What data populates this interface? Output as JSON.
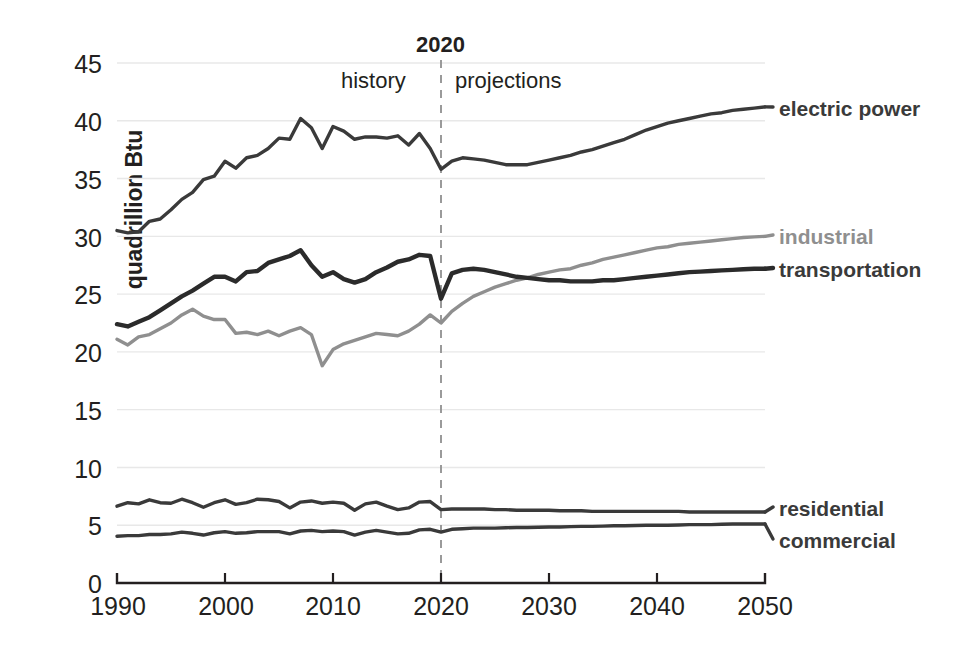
{
  "chart_data": {
    "type": "line",
    "title": "",
    "xlabel": "",
    "ylabel": "quadrillion Btu",
    "xlim": [
      1990,
      2050
    ],
    "ylim": [
      0,
      45
    ],
    "grid": true,
    "legend_position": "right-inline",
    "xticks": [
      1990,
      2000,
      2010,
      2020,
      2030,
      2040,
      2050
    ],
    "yticks": [
      0,
      5,
      10,
      15,
      20,
      25,
      30,
      35,
      40,
      45
    ],
    "annotations": {
      "divider_year": "2020",
      "left_region": "history",
      "right_region": "projections"
    },
    "colors": {
      "electric_power": "#3a3a3a",
      "industrial": "#8f8f8f",
      "transportation": "#2b2b2b",
      "residential": "#3a3a3a",
      "commercial": "#3a3a3a",
      "grid": "#e8e8e8",
      "axis": "#231f20",
      "divider": "#9a9a9a"
    },
    "x": [
      1990,
      1991,
      1992,
      1993,
      1994,
      1995,
      1996,
      1997,
      1998,
      1999,
      2000,
      2001,
      2002,
      2003,
      2004,
      2005,
      2006,
      2007,
      2008,
      2009,
      2010,
      2011,
      2012,
      2013,
      2014,
      2015,
      2016,
      2017,
      2018,
      2019,
      2020,
      2021,
      2022,
      2023,
      2024,
      2025,
      2026,
      2027,
      2028,
      2029,
      2030,
      2031,
      2032,
      2033,
      2034,
      2035,
      2036,
      2037,
      2038,
      2039,
      2040,
      2041,
      2042,
      2043,
      2044,
      2045,
      2046,
      2047,
      2048,
      2049,
      2050
    ],
    "series": [
      {
        "name": "electric power",
        "color": "#3a3a3a",
        "label_x": 779,
        "label_y": 98,
        "values": [
          30.5,
          30.3,
          30.4,
          31.3,
          31.5,
          32.3,
          33.2,
          33.8,
          34.9,
          35.2,
          36.5,
          35.9,
          36.8,
          37.0,
          37.6,
          38.5,
          38.4,
          40.2,
          39.4,
          37.6,
          39.5,
          39.1,
          38.4,
          38.6,
          38.6,
          38.5,
          38.7,
          37.9,
          38.9,
          37.6,
          35.8,
          36.5,
          36.8,
          36.7,
          36.6,
          36.4,
          36.2,
          36.2,
          36.2,
          36.4,
          36.6,
          36.8,
          37.0,
          37.3,
          37.5,
          37.8,
          38.1,
          38.4,
          38.8,
          39.2,
          39.5,
          39.8,
          40.0,
          40.2,
          40.4,
          40.6,
          40.7,
          40.9,
          41.0,
          41.1,
          41.2
        ]
      },
      {
        "name": "industrial",
        "color": "#8f8f8f",
        "label_x": 779,
        "label_y": 226,
        "values": [
          21.1,
          20.6,
          21.3,
          21.5,
          22.0,
          22.5,
          23.2,
          23.7,
          23.1,
          22.8,
          22.8,
          21.6,
          21.7,
          21.5,
          21.8,
          21.4,
          21.8,
          22.1,
          21.5,
          18.8,
          20.2,
          20.7,
          21.0,
          21.3,
          21.6,
          21.5,
          21.4,
          21.8,
          22.4,
          23.2,
          22.5,
          23.5,
          24.2,
          24.8,
          25.2,
          25.6,
          25.9,
          26.2,
          26.4,
          26.7,
          26.9,
          27.1,
          27.2,
          27.5,
          27.7,
          28.0,
          28.2,
          28.4,
          28.6,
          28.8,
          29.0,
          29.1,
          29.3,
          29.4,
          29.5,
          29.6,
          29.7,
          29.8,
          29.9,
          29.95,
          30.0
        ]
      },
      {
        "name": "transportation",
        "color": "#2b2b2b",
        "label_x": 779,
        "label_y": 259,
        "values": [
          22.4,
          22.2,
          22.6,
          23.0,
          23.6,
          24.2,
          24.8,
          25.3,
          25.9,
          26.5,
          26.5,
          26.1,
          26.9,
          27.0,
          27.7,
          28.0,
          28.3,
          28.8,
          27.5,
          26.5,
          26.9,
          26.3,
          26.0,
          26.3,
          26.9,
          27.3,
          27.8,
          28.0,
          28.4,
          28.3,
          24.6,
          26.8,
          27.1,
          27.2,
          27.1,
          26.9,
          26.7,
          26.5,
          26.4,
          26.3,
          26.2,
          26.2,
          26.1,
          26.1,
          26.1,
          26.2,
          26.2,
          26.3,
          26.4,
          26.5,
          26.6,
          26.7,
          26.8,
          26.9,
          26.95,
          27.0,
          27.05,
          27.1,
          27.15,
          27.2,
          27.2
        ]
      },
      {
        "name": "residential",
        "color": "#3a3a3a",
        "label_x": 779,
        "label_y": 498,
        "values": [
          6.65,
          6.95,
          6.85,
          7.2,
          6.95,
          6.9,
          7.25,
          6.95,
          6.55,
          6.95,
          7.2,
          6.8,
          6.95,
          7.25,
          7.2,
          7.05,
          6.5,
          7.0,
          7.1,
          6.9,
          7.0,
          6.9,
          6.3,
          6.85,
          7.0,
          6.65,
          6.35,
          6.5,
          7.0,
          7.05,
          6.35,
          6.4,
          6.4,
          6.4,
          6.4,
          6.35,
          6.35,
          6.3,
          6.3,
          6.3,
          6.3,
          6.25,
          6.25,
          6.25,
          6.2,
          6.2,
          6.2,
          6.2,
          6.2,
          6.2,
          6.2,
          6.2,
          6.2,
          6.15,
          6.15,
          6.15,
          6.15,
          6.15,
          6.15,
          6.15,
          6.15
        ]
      },
      {
        "name": "commercial",
        "color": "#3a3a3a",
        "label_x": 779,
        "label_y": 530,
        "values": [
          4.05,
          4.1,
          4.1,
          4.2,
          4.2,
          4.25,
          4.4,
          4.3,
          4.15,
          4.35,
          4.45,
          4.3,
          4.35,
          4.45,
          4.45,
          4.45,
          4.25,
          4.5,
          4.55,
          4.45,
          4.5,
          4.45,
          4.15,
          4.4,
          4.55,
          4.4,
          4.25,
          4.3,
          4.6,
          4.65,
          4.4,
          4.65,
          4.7,
          4.75,
          4.75,
          4.75,
          4.78,
          4.8,
          4.8,
          4.82,
          4.85,
          4.85,
          4.88,
          4.9,
          4.9,
          4.92,
          4.95,
          4.95,
          4.98,
          5.0,
          5.0,
          5.0,
          5.02,
          5.05,
          5.05,
          5.05,
          5.08,
          5.1,
          5.1,
          5.1,
          5.1
        ]
      }
    ]
  },
  "axis": {
    "y_title": "quadrillion Btu",
    "y_ticks": [
      "45",
      "40",
      "35",
      "30",
      "25",
      "20",
      "15",
      "10",
      "5",
      "0"
    ],
    "x_ticks": [
      "1990",
      "2000",
      "2010",
      "2020",
      "2030",
      "2040",
      "2050"
    ]
  },
  "divider": {
    "year": "2020",
    "history": "history",
    "projections": "projections"
  },
  "labels": {
    "electric_power": "electric power",
    "industrial": "industrial",
    "transportation": "transportation",
    "residential": "residential",
    "commercial": "commercial"
  }
}
